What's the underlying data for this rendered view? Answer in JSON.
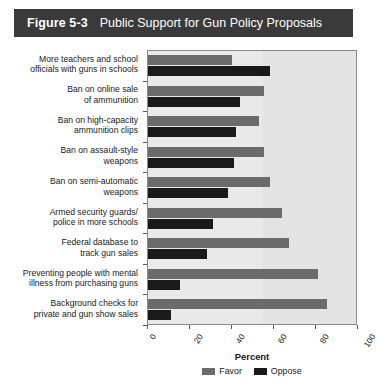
{
  "figure": {
    "number": "Figure 5-3",
    "title": "Public Support for Gun Policy Proposals"
  },
  "colors": {
    "banner_bg": "#3a3a3a",
    "favor": "#6b6b6b",
    "oppose": "#1a1a1a",
    "plot_bg": "#e9e9e9"
  },
  "chart_data": {
    "type": "bar",
    "orientation": "horizontal",
    "title": "Public Support for Gun Policy Proposals",
    "xlabel": "Percent",
    "ylabel": "",
    "xlim": [
      0,
      100
    ],
    "xticks": [
      0,
      20,
      40,
      60,
      80,
      100
    ],
    "xtick_labels": [
      "0",
      "20",
      "40",
      "60",
      "80",
      "100"
    ],
    "grid": false,
    "legend_position": "bottom-center",
    "categories": [
      "More teachers and school officials with guns in schools",
      "Ban on online sale of ammunition",
      "Ban on high-capacity ammunition clips",
      "Ban on assault-style weapons",
      "Ban on semi-automatic weapons",
      "Armed security guards/ police in more schools",
      "Federal database to track gun sales",
      "Preventing people with mental illness from purchasing guns",
      "Background checks for private and gun show sales"
    ],
    "category_lines": [
      [
        "More teachers and school",
        "officials with guns in schools"
      ],
      [
        "Ban on online sale",
        "of ammunition"
      ],
      [
        "Ban on high-capacity",
        "ammunition clips"
      ],
      [
        "Ban on assault-style",
        "weapons"
      ],
      [
        "Ban on semi-automatic",
        "weapons"
      ],
      [
        "Armed security guards/",
        "police in more schools"
      ],
      [
        "Federal database to",
        "track gun sales"
      ],
      [
        "Preventing people with mental",
        "illness from purchasing guns"
      ],
      [
        "Background checks for",
        "private and gun show sales"
      ]
    ],
    "series": [
      {
        "name": "Favor",
        "color": "#6b6b6b",
        "values": [
          40,
          55,
          53,
          55,
          58,
          64,
          67,
          81,
          85
        ]
      },
      {
        "name": "Oppose",
        "color": "#1a1a1a",
        "values": [
          58,
          44,
          42,
          41,
          38,
          31,
          28,
          15,
          11
        ]
      }
    ]
  }
}
